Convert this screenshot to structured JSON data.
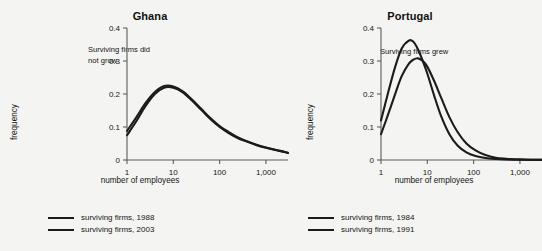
{
  "background_color": "#f4f4f2",
  "chart_data": [
    {
      "type": "line",
      "title": "Ghana",
      "xlabel": "number of employees",
      "ylabel": "frequency",
      "annotation": "Surviving firms did\nnot grow",
      "xscale": "log",
      "xlim": [
        1,
        3000
      ],
      "ylim": [
        0,
        0.4
      ],
      "xticks": [
        1,
        10,
        100,
        1000
      ],
      "xticklabels": [
        "1",
        "10",
        "100",
        "1,000"
      ],
      "yticks": [
        0,
        0.1,
        0.2,
        0.3,
        0.4
      ],
      "yticklabels": [
        "0",
        "0.1",
        "0.2",
        "0.3",
        "0.4"
      ],
      "grid": false,
      "legend_position": "below",
      "series": [
        {
          "name": "surviving firms, 1988",
          "color": "#1b1b1b",
          "x": [
            1,
            1.6,
            2.5,
            4,
            6.3,
            10,
            16,
            25,
            40,
            63,
            100,
            160,
            250,
            400,
            630,
            1000,
            1600,
            2500,
            3000
          ],
          "y": [
            0.075,
            0.118,
            0.163,
            0.2,
            0.219,
            0.219,
            0.205,
            0.181,
            0.152,
            0.124,
            0.1,
            0.081,
            0.066,
            0.055,
            0.045,
            0.037,
            0.03,
            0.024,
            0.021
          ]
        },
        {
          "name": "surviving firms, 2003",
          "color": "#1b1b1b",
          "x": [
            1,
            1.6,
            2.5,
            4,
            6.3,
            10,
            16,
            25,
            40,
            63,
            100,
            160,
            250,
            400,
            630,
            1000,
            1600,
            2500,
            3000
          ],
          "y": [
            0.088,
            0.13,
            0.172,
            0.206,
            0.224,
            0.223,
            0.208,
            0.184,
            0.155,
            0.127,
            0.103,
            0.084,
            0.068,
            0.056,
            0.046,
            0.038,
            0.031,
            0.025,
            0.022
          ]
        }
      ],
      "legend": [
        {
          "label": "surviving firms, 1988",
          "color": "#1b1b1b"
        },
        {
          "label": "surviving firms, 2003",
          "color": "#1b1b1b"
        }
      ]
    },
    {
      "type": "line",
      "title": "Portugal",
      "xlabel": "number of employees",
      "ylabel": "frequency",
      "annotation": "Surviving firms grew",
      "xscale": "log",
      "xlim": [
        1,
        3000
      ],
      "ylim": [
        0,
        0.4
      ],
      "xticks": [
        1,
        10,
        100,
        1000
      ],
      "xticklabels": [
        "1",
        "10",
        "100",
        "1,000"
      ],
      "yticks": [
        0,
        0.1,
        0.2,
        0.3,
        0.4
      ],
      "yticklabels": [
        "0",
        "0.1",
        "0.2",
        "0.3",
        "0.4"
      ],
      "grid": false,
      "legend_position": "below",
      "series": [
        {
          "name": "surviving firms, 1984",
          "color": "#1b1b1b",
          "x": [
            1,
            1.4,
            2,
            2.8,
            4,
            5,
            6.3,
            8,
            10,
            14,
            20,
            30,
            45,
            70,
            110,
            180,
            300,
            500,
            1000,
            2000,
            3000
          ],
          "y": [
            0.12,
            0.2,
            0.28,
            0.338,
            0.362,
            0.358,
            0.335,
            0.3,
            0.262,
            0.196,
            0.132,
            0.078,
            0.044,
            0.023,
            0.012,
            0.006,
            0.003,
            0.0015,
            0.0008,
            0.0004,
            0.0003
          ]
        },
        {
          "name": "surviving firms, 1991",
          "color": "#1b1b1b",
          "x": [
            1,
            1.4,
            2,
            2.8,
            4,
            5,
            6.3,
            8,
            10,
            14,
            20,
            30,
            45,
            70,
            110,
            180,
            300,
            500,
            1000,
            2000,
            3000
          ],
          "y": [
            0.078,
            0.135,
            0.198,
            0.254,
            0.292,
            0.304,
            0.308,
            0.3,
            0.283,
            0.24,
            0.188,
            0.13,
            0.085,
            0.05,
            0.029,
            0.015,
            0.007,
            0.004,
            0.0018,
            0.0008,
            0.0005
          ]
        }
      ],
      "legend": [
        {
          "label": "surviving firms, 1984",
          "color": "#1b1b1b"
        },
        {
          "label": "surviving firms, 1991",
          "color": "#1b1b1b"
        }
      ]
    }
  ]
}
